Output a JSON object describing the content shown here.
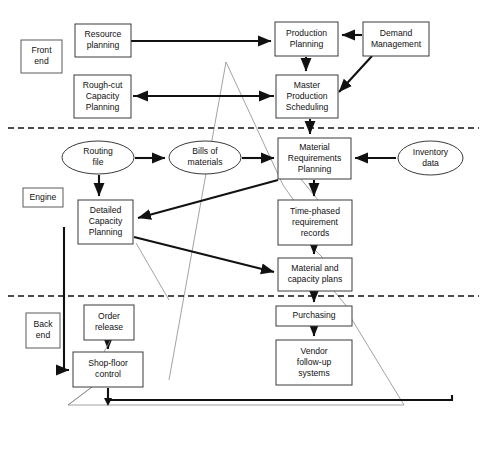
{
  "diagram": {
    "colors": {
      "background": "#ffffff",
      "box_stroke": "#3a3a3a",
      "text": "#111111",
      "flow_arrow": "#111111",
      "thin_feedback": "#8a8a8a",
      "divider": "#111111"
    },
    "section_labels": [
      {
        "id": "front-end",
        "text_lines": [
          "Front",
          "end"
        ],
        "x": 21,
        "y": 40,
        "w": 41,
        "h": 33
      },
      {
        "id": "engine",
        "text_lines": [
          "Engine"
        ],
        "x": 23,
        "y": 188,
        "w": 40,
        "h": 19
      },
      {
        "id": "back-end",
        "text_lines": [
          "Back",
          "end"
        ],
        "x": 26,
        "y": 313,
        "w": 34,
        "h": 35
      }
    ],
    "nodes": [
      {
        "id": "resource-planning",
        "shape": "rect",
        "text_lines": [
          "Resource",
          "planning"
        ],
        "x": 75,
        "y": 24,
        "w": 56,
        "h": 33
      },
      {
        "id": "production-planning",
        "shape": "rect",
        "text_lines": [
          "Production",
          "Planning"
        ],
        "x": 275,
        "y": 22,
        "w": 63,
        "h": 34
      },
      {
        "id": "demand-management",
        "shape": "rect",
        "text_lines": [
          "Demand",
          "Management"
        ],
        "x": 363,
        "y": 22,
        "w": 66,
        "h": 34
      },
      {
        "id": "rough-cut-capacity-planning",
        "shape": "rect",
        "text_lines": [
          "Rough-cut",
          "Capacity",
          "Planning"
        ],
        "x": 74,
        "y": 75,
        "w": 57,
        "h": 43
      },
      {
        "id": "master-production-scheduling",
        "shape": "rect",
        "text_lines": [
          "Master",
          "Production",
          "Scheduling"
        ],
        "x": 276,
        "y": 75,
        "w": 62,
        "h": 43
      },
      {
        "id": "routing-file",
        "shape": "ellipse",
        "text_lines": [
          "Routing",
          "file"
        ],
        "x": 62,
        "y": 141,
        "w": 72,
        "h": 33
      },
      {
        "id": "bills-of-materials",
        "shape": "ellipse",
        "text_lines": [
          "Bills of",
          "materials"
        ],
        "x": 169,
        "y": 141,
        "w": 72,
        "h": 33
      },
      {
        "id": "material-requirements-planning",
        "shape": "rect",
        "text_lines": [
          "Material",
          "Requirements",
          "Planning"
        ],
        "x": 278,
        "y": 138,
        "w": 73,
        "h": 41
      },
      {
        "id": "inventory-data",
        "shape": "ellipse",
        "text_lines": [
          "Inventory",
          "data"
        ],
        "x": 398,
        "y": 141,
        "w": 65,
        "h": 34
      },
      {
        "id": "detailed-capacity-planning",
        "shape": "rect",
        "text_lines": [
          "Detailed",
          "Capacity",
          "Planning"
        ],
        "x": 78,
        "y": 200,
        "w": 55,
        "h": 44
      },
      {
        "id": "time-phased-requirement-records",
        "shape": "rect",
        "text_lines": [
          "Time-phased",
          "requirement",
          "records"
        ],
        "x": 278,
        "y": 200,
        "w": 74,
        "h": 45
      },
      {
        "id": "material-and-capacity-plans",
        "shape": "rect",
        "text_lines": [
          "Material and",
          "capacity plans"
        ],
        "x": 278,
        "y": 258,
        "w": 74,
        "h": 33
      },
      {
        "id": "order-release",
        "shape": "rect",
        "text_lines": [
          "Order",
          "release"
        ],
        "x": 84,
        "y": 305,
        "w": 50,
        "h": 35
      },
      {
        "id": "purchasing",
        "shape": "rect",
        "text_lines": [
          "Purchasing"
        ],
        "x": 276,
        "y": 306,
        "w": 76,
        "h": 20
      },
      {
        "id": "shop-floor-control",
        "shape": "rect",
        "text_lines": [
          "Shop-floor",
          "control"
        ],
        "x": 73,
        "y": 352,
        "w": 70,
        "h": 35
      },
      {
        "id": "vendor-follow-up-systems",
        "shape": "rect",
        "text_lines": [
          "Vendor",
          "follow-up",
          "systems"
        ],
        "x": 276,
        "y": 340,
        "w": 76,
        "h": 45
      }
    ],
    "dividers": [
      {
        "id": "front-end-engine-divider",
        "x1": 8,
        "y1": 128,
        "x2": 479,
        "y2": 128
      },
      {
        "id": "engine-back-end-divider",
        "x1": 8,
        "y1": 296,
        "x2": 479,
        "y2": 296
      }
    ],
    "flows": [
      {
        "id": "resource-planning-to-production-planning",
        "from": "resource-planning",
        "to": "production-planning"
      },
      {
        "id": "demand-management-to-production-planning",
        "from": "demand-management",
        "to": "production-planning"
      },
      {
        "id": "demand-management-to-master-production-scheduling",
        "from": "demand-management",
        "to": "master-production-scheduling"
      },
      {
        "id": "production-planning-to-master-production-scheduling",
        "from": "production-planning",
        "to": "master-production-scheduling"
      },
      {
        "id": "master-production-scheduling-to-rough-cut-capacity-planning",
        "from": "master-production-scheduling",
        "to": "rough-cut-capacity-planning"
      },
      {
        "id": "rough-cut-capacity-planning-to-master-production-scheduling",
        "from": "rough-cut-capacity-planning",
        "to": "master-production-scheduling"
      },
      {
        "id": "master-production-scheduling-to-material-requirements-planning",
        "from": "master-production-scheduling",
        "to": "material-requirements-planning"
      },
      {
        "id": "routing-file-to-bills-of-materials",
        "from": "routing-file",
        "to": "bills-of-materials"
      },
      {
        "id": "routing-file-to-detailed-capacity-planning",
        "from": "routing-file",
        "to": "detailed-capacity-planning"
      },
      {
        "id": "bills-of-materials-to-material-requirements-planning",
        "from": "bills-of-materials",
        "to": "material-requirements-planning"
      },
      {
        "id": "inventory-data-to-material-requirements-planning",
        "from": "inventory-data",
        "to": "material-requirements-planning"
      },
      {
        "id": "material-requirements-planning-to-detailed-capacity-planning",
        "from": "material-requirements-planning",
        "to": "detailed-capacity-planning"
      },
      {
        "id": "material-requirements-planning-to-time-phased-requirement-records",
        "from": "material-requirements-planning",
        "to": "time-phased-requirement-records"
      },
      {
        "id": "time-phased-requirement-records-to-material-and-capacity-plans",
        "from": "time-phased-requirement-records",
        "to": "material-and-capacity-plans"
      },
      {
        "id": "detailed-capacity-planning-to-material-and-capacity-plans",
        "from": "detailed-capacity-planning",
        "to": "material-and-capacity-plans"
      },
      {
        "id": "material-and-capacity-plans-to-purchasing",
        "from": "material-and-capacity-plans",
        "to": "purchasing"
      },
      {
        "id": "order-release-to-shop-floor-control",
        "from": "order-release",
        "to": "shop-floor-control"
      },
      {
        "id": "shop-floor-control-to-order-release",
        "from": "shop-floor-control",
        "to": "order-release"
      },
      {
        "id": "purchasing-to-vendor-follow-up-systems",
        "from": "purchasing",
        "to": "vendor-follow-up-systems"
      },
      {
        "id": "shop-floor-control-feedback-to-detailed-capacity-planning",
        "from": "shop-floor-control",
        "to": "detailed-capacity-planning"
      }
    ]
  }
}
